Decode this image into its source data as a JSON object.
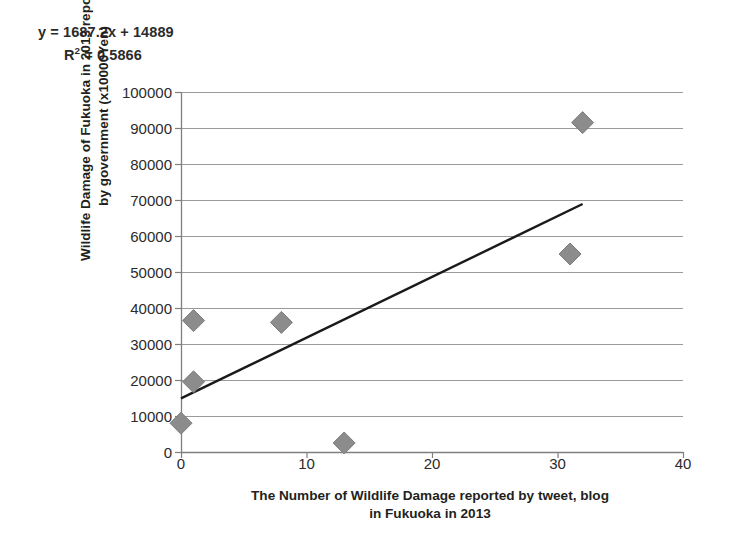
{
  "annotation": {
    "equation": "y = 1687.2x + 14889",
    "r_squared_label": "R",
    "r_squared_exp": "2",
    "r_squared_value": " = 0.5866"
  },
  "axis_titles": {
    "y_line1": "Wildlife Damage of Fukuoka in 2013 reported",
    "y_line2": "by government (x10000Yen)",
    "x_line1": "The Number of Wildlife Damage reported by tweet, blog",
    "x_line2": "in Fukuoka in 2013"
  },
  "ticks": {
    "y": [
      "100000",
      "90000",
      "80000",
      "70000",
      "60000",
      "50000",
      "40000",
      "30000",
      "20000",
      "10000",
      "0"
    ],
    "x": [
      "0",
      "10",
      "20",
      "30",
      "40"
    ]
  },
  "colors": {
    "marker": "#8c8c8c",
    "marker_edge": "#7d7d7d",
    "trendline": "#1a1a1a",
    "gridline": "#9a9a9a",
    "axis": "#7f7f7f",
    "text": "#231f20",
    "background": "#ffffff"
  },
  "chart_data": {
    "type": "scatter",
    "title": "",
    "xlabel": "The Number of Wildlife Damage reported by tweet, blog in Fukuoka in 2013",
    "ylabel": "Wildlife Damage of Fukuoka in 2013 reported by government (x10000Yen)",
    "xlim": [
      0,
      40
    ],
    "ylim": [
      0,
      100000
    ],
    "xticks": [
      0,
      10,
      20,
      30,
      40
    ],
    "yticks": [
      0,
      10000,
      20000,
      30000,
      40000,
      50000,
      60000,
      70000,
      80000,
      90000,
      100000
    ],
    "grid": "horizontal",
    "legend": "none",
    "marker_shape": "diamond",
    "points": [
      {
        "x": 0,
        "y": 8000
      },
      {
        "x": 1,
        "y": 19500
      },
      {
        "x": 1,
        "y": 36500
      },
      {
        "x": 8,
        "y": 36000
      },
      {
        "x": 13,
        "y": 2500
      },
      {
        "x": 31,
        "y": 55000
      },
      {
        "x": 32,
        "y": 91500
      }
    ],
    "trendline": {
      "type": "linear",
      "slope": 1687.2,
      "intercept": 14889,
      "r_squared": 0.5866,
      "x_start": 0,
      "x_end": 32,
      "equation_text": "y = 1687.2x + 14889",
      "r2_text": "R² = 0.5866"
    }
  }
}
